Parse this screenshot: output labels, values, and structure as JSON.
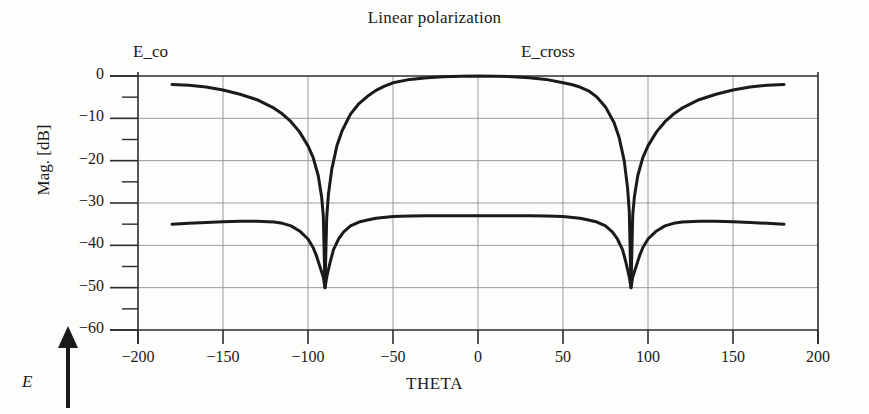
{
  "chart_data": {
    "type": "line",
    "title": "Linear polarization",
    "xlabel": "THETA",
    "ylabel": "Mag. [dB]",
    "xlim": [
      -200,
      200
    ],
    "ylim": [
      -60,
      0
    ],
    "xticks": [
      -200,
      -150,
      -100,
      -50,
      0,
      50,
      100,
      150,
      200
    ],
    "xtick_labels": [
      "−200",
      "−150",
      "−100",
      "−50",
      "0",
      "50",
      "100",
      "150",
      "200"
    ],
    "yticks": [
      0,
      -10,
      -20,
      -30,
      -40,
      -50,
      -60
    ],
    "ytick_labels": [
      "0",
      "−10",
      "−20",
      "−30",
      "−40",
      "−50",
      "−60"
    ],
    "yminor_ticks": [
      -5,
      -15,
      -25,
      -35,
      -45,
      -55
    ],
    "grid": true,
    "legend_position": "above-plot-inline",
    "annotations": [
      {
        "text": "E_co",
        "x": -175,
        "y": 3
      },
      {
        "text": "E_cross",
        "x": 30,
        "y": 3
      },
      {
        "text": "E",
        "note": "field-direction arrow pointing up, lower-left of axes"
      }
    ],
    "series": [
      {
        "name": "E_co",
        "color": "#1a1a1a",
        "x": [
          -180,
          -170,
          -160,
          -150,
          -140,
          -130,
          -120,
          -115,
          -110,
          -105,
          -100,
          -97,
          -94,
          -92,
          -91,
          -90,
          -89,
          -88,
          -86,
          -83,
          -80,
          -75,
          -70,
          -65,
          -60,
          -55,
          -50,
          -40,
          -30,
          -20,
          -10,
          0,
          10,
          20,
          30,
          40,
          50,
          55,
          60,
          65,
          70,
          75,
          80,
          83,
          86,
          88,
          89,
          90,
          91,
          92,
          94,
          97,
          100,
          105,
          110,
          115,
          120,
          130,
          140,
          150,
          160,
          170,
          180
        ],
        "y": [
          -2.0,
          -2.2,
          -2.6,
          -3.3,
          -4.3,
          -5.6,
          -7.6,
          -9.0,
          -10.8,
          -13.2,
          -16.5,
          -19.2,
          -23.5,
          -28.5,
          -33.0,
          -50.0,
          -33.5,
          -28.0,
          -22.0,
          -16.5,
          -13.0,
          -9.0,
          -6.5,
          -4.8,
          -3.4,
          -2.4,
          -1.6,
          -0.8,
          -0.4,
          -0.15,
          -0.05,
          0.0,
          -0.05,
          -0.15,
          -0.4,
          -0.8,
          -1.6,
          -2.0,
          -2.6,
          -3.5,
          -5.0,
          -7.3,
          -11.0,
          -14.5,
          -20.0,
          -26.5,
          -32.0,
          -50.0,
          -33.0,
          -28.5,
          -23.5,
          -19.2,
          -16.5,
          -13.2,
          -10.8,
          -9.0,
          -7.6,
          -5.6,
          -4.3,
          -3.3,
          -2.6,
          -2.2,
          -2.0
        ]
      },
      {
        "name": "E_cross",
        "color": "#1a1a1a",
        "x": [
          -180,
          -170,
          -160,
          -150,
          -140,
          -130,
          -120,
          -115,
          -110,
          -105,
          -100,
          -97,
          -95,
          -93,
          -91,
          -90,
          -89,
          -87,
          -85,
          -82,
          -79,
          -75,
          -70,
          -65,
          -60,
          -50,
          -40,
          -30,
          -20,
          -10,
          0,
          10,
          20,
          30,
          40,
          50,
          60,
          65,
          70,
          75,
          79,
          82,
          85,
          87,
          89,
          90,
          91,
          93,
          95,
          97,
          100,
          105,
          110,
          115,
          120,
          130,
          140,
          150,
          160,
          170,
          180
        ],
        "y": [
          -35.0,
          -34.8,
          -34.6,
          -34.4,
          -34.3,
          -34.3,
          -34.5,
          -34.8,
          -35.4,
          -36.6,
          -38.5,
          -40.5,
          -42.5,
          -45.0,
          -47.5,
          -50.0,
          -47.5,
          -44.0,
          -41.0,
          -38.5,
          -36.8,
          -35.4,
          -34.5,
          -34.0,
          -33.6,
          -33.2,
          -33.1,
          -33.0,
          -33.0,
          -33.0,
          -33.0,
          -33.0,
          -33.0,
          -33.0,
          -33.1,
          -33.2,
          -33.6,
          -34.0,
          -34.5,
          -35.4,
          -36.8,
          -38.5,
          -41.0,
          -44.0,
          -47.5,
          -50.0,
          -47.5,
          -45.0,
          -42.5,
          -40.5,
          -38.5,
          -36.6,
          -35.4,
          -34.8,
          -34.5,
          -34.3,
          -34.3,
          -34.4,
          -34.6,
          -34.8,
          -35.0
        ]
      }
    ]
  },
  "style": {
    "axis_color": "#2b2b2b",
    "grid_color": "#9a9a9a",
    "curve_color": "#1a1a1a",
    "background": "#fdfdfc"
  }
}
